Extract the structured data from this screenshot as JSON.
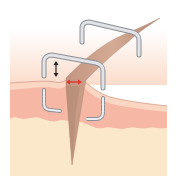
{
  "diagram": {
    "colors": {
      "background": "#ffffff",
      "epidermis_top": "#fdf3ea",
      "epidermis": "#fbd9c6",
      "dermis": "#f6b8a6",
      "hypodermis": "#fbe9cc",
      "hair": "#c89a84",
      "hair_dark": "#a9806c",
      "staple_fill": "#dcdde0",
      "staple_stroke": "#8c8f96",
      "arrow_vertical": "#222222",
      "arrow_horizontal": "#e3342f"
    },
    "elements": [
      {
        "name": "staple-back",
        "kind": "staple above skin"
      },
      {
        "name": "staple-front",
        "kind": "staple above skin"
      },
      {
        "name": "staple-embedded-legs",
        "kind": "dashed staple legs under skin"
      },
      {
        "name": "hair-shaft",
        "kind": "hair crossing skin"
      },
      {
        "name": "vertical-arrow",
        "kind": "gap indicator"
      },
      {
        "name": "horizontal-arrow",
        "kind": "wound edge indicator"
      }
    ]
  }
}
